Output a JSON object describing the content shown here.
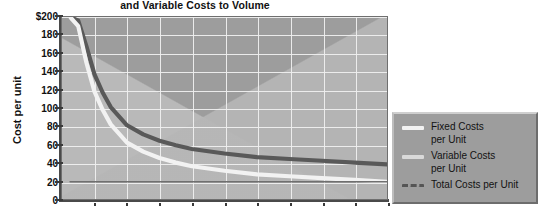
{
  "chart_data": {
    "type": "line",
    "title": "and Variable Costs to Volume",
    "xlabel": "",
    "ylabel": "Cost per unit",
    "ylim": [
      0,
      200
    ],
    "yticks": [
      0,
      20,
      40,
      60,
      80,
      100,
      120,
      140,
      160,
      180,
      200
    ],
    "ytick_labels": [
      "0",
      "20",
      "40",
      "60",
      "80",
      "100",
      "120",
      "140",
      "160",
      "180",
      "$200"
    ],
    "xlim": [
      0,
      10
    ],
    "xticks": [
      0,
      1,
      2,
      3,
      4,
      5,
      6,
      7,
      8,
      9,
      10
    ],
    "xtick_labels": [
      "",
      "",
      "",
      "",
      "",
      "",
      "",
      "",
      "",
      "",
      ""
    ],
    "grid": true,
    "legend_position": "right",
    "x": [
      0.25,
      0.5,
      0.75,
      1,
      1.25,
      1.5,
      2,
      2.5,
      3,
      3.5,
      4,
      5,
      6,
      7,
      8,
      9,
      10
    ],
    "series": [
      {
        "name": "Fixed Costs per Unit",
        "color": "#f2f2f2",
        "values": [
          200,
          190,
          150,
          118,
          98,
          82,
          62,
          52,
          45,
          40,
          36,
          31,
          27,
          25,
          23,
          21,
          19
        ]
      },
      {
        "name": "Variable Costs per Unit",
        "color": "#6f6f6f",
        "values": [
          19,
          19,
          19,
          19,
          19,
          19,
          19,
          19,
          19,
          19,
          19,
          19,
          19,
          19,
          19,
          19,
          19
        ]
      },
      {
        "name": "Total Costs per Unit",
        "color": "#595959",
        "values": [
          200,
          196,
          168,
          137,
          117,
          101,
          81,
          71,
          64,
          59,
          55,
          50,
          46,
          44,
          42,
          40,
          38
        ]
      }
    ]
  },
  "legend": {
    "items": [
      {
        "label_line1": "Fixed Costs",
        "label_line2": "per Unit",
        "style": "solid",
        "color": "#f2f2f2"
      },
      {
        "label_line1": "Variable Costs",
        "label_line2": "per Unit",
        "style": "solid",
        "color": "#d9d9d9"
      },
      {
        "label_line1": "Total Costs per Unit",
        "label_line2": "",
        "style": "dashed",
        "color": "#555555"
      }
    ]
  },
  "colors": {
    "plot_background": "#9d9d9d",
    "wedge_light": "#b9b9b9",
    "gridline": "#efefef",
    "axis": "#4a4a4a",
    "text": "#111111",
    "page_background": "#ffffff"
  }
}
